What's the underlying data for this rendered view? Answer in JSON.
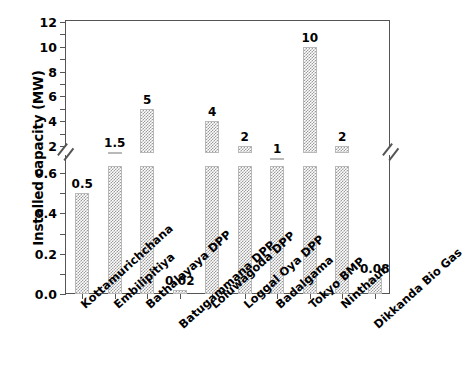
{
  "chart_data": {
    "type": "bar",
    "title": "",
    "xlabel": "",
    "ylabel": "Installed capacity (MW)",
    "categories": [
      "Kottamurichchana",
      "Embilipitiya",
      "Bathalayaya DPP",
      "Batugammana DPP",
      "Loluwagoda DPP",
      "Loggal Oya DPP",
      "Badalgama",
      "Tokyo BMP",
      "Ninthaur",
      "Dikkanda Bio Gas"
    ],
    "values": [
      0.5,
      1.5,
      5,
      0.02,
      4,
      2,
      1,
      10,
      2,
      0.08
    ],
    "value_labels": [
      "0.5",
      "1.5",
      "5",
      "0.02",
      "4",
      "2",
      "1",
      "10",
      "2",
      "0.08"
    ],
    "axis_break": true,
    "axis_break_note": "y-axis broken between 0.6 and 2",
    "y_lower_ticks": [
      "0.0",
      "0.2",
      "0.4",
      "0.6"
    ],
    "y_lower_values": [
      0.0,
      0.2,
      0.4,
      0.6
    ],
    "y_upper_ticks": [
      "2",
      "4",
      "6",
      "8",
      "10",
      "12"
    ],
    "y_upper_values": [
      2,
      4,
      6,
      8,
      10,
      12
    ],
    "ylim_lower": [
      0.0,
      0.6
    ],
    "ylim_upper": [
      2,
      12
    ],
    "grid": false,
    "legend": null,
    "bar_color": "#9b9b9b",
    "bar_pattern": "checkerboard-dither",
    "axis_color": "#555555",
    "background": "#ffffff"
  }
}
